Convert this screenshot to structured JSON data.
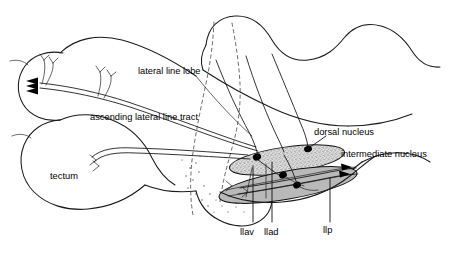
{
  "figure": {
    "background_color": "#ffffff",
    "ink_color": "#1a1a1a"
  },
  "labels": {
    "lateral_line_lobe": "lateral line lobe",
    "ascending_lateral_line_tract": "ascending lateral line tract",
    "tectum": "tectum",
    "dorsal_nucleus": "dorsal nucleus",
    "intermediate_nucleus": "intermediate nucleus",
    "llav": "llav",
    "llad": "llad",
    "llp": "llp"
  },
  "structures": [
    {
      "name": "dorsal-nucleus",
      "label": "dorsal nucleus",
      "fill_style": "stipple",
      "fill_color": "#d6d6d6"
    },
    {
      "name": "intermediate-nucleus",
      "label": "intermediate nucleus",
      "fill_style": "solid-gray",
      "fill_color": "#b9b9b9"
    },
    {
      "name": "tectum",
      "label": "tectum",
      "fill_style": "none",
      "fill_color": "#ffffff"
    },
    {
      "name": "lateral-line-lobe",
      "label": "lateral line lobe",
      "fill_style": "none",
      "fill_color": "#ffffff"
    }
  ],
  "nerves": [
    {
      "abbreviation": "llav",
      "position": "ventral-anterior"
    },
    {
      "abbreviation": "llad",
      "position": "dorsal-anterior"
    },
    {
      "abbreviation": "llp",
      "position": "posterior"
    }
  ],
  "tracts": [
    {
      "name": "ascending lateral line tract",
      "terminal_arrow_count": 3
    }
  ]
}
